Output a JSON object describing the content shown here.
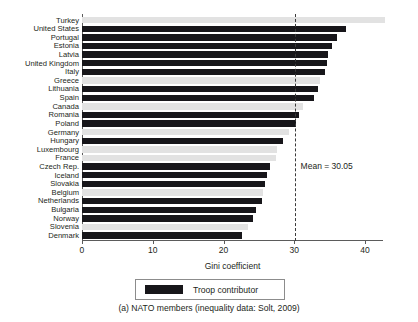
{
  "caption": "(a) NATO members (inequality data: Solt, 2009)",
  "legend": {
    "items": [
      {
        "label": "Troop contributor",
        "color": "#17161a",
        "swatch_name": "troop-contributor-swatch"
      }
    ]
  },
  "annotations": {
    "mean_label": "Mean = 30.05",
    "mean_value": 30.05
  },
  "axis": {
    "x_title": "Gini coefficient",
    "x_ticks": [
      "0",
      "10",
      "20",
      "30",
      "40"
    ]
  },
  "colors": {
    "troop_contributor": "#17161a",
    "non_contributor": "#e2e2e2",
    "axis": "#5b5b5b",
    "mean_line": "#3a3a3a",
    "text": "#231f20"
  },
  "chart_data": {
    "type": "bar",
    "orientation": "horizontal",
    "title": "",
    "subtitle": "",
    "xlabel": "Gini coefficient",
    "ylabel": "",
    "xlim": [
      0,
      42.5
    ],
    "xticks": [
      0,
      10,
      20,
      30,
      40
    ],
    "grid": false,
    "legend_position": "bottom",
    "annotations": [
      {
        "type": "vline",
        "value": 30.05,
        "label": "Mean = 30.05",
        "style": "dashed"
      }
    ],
    "series": [
      {
        "name": "Troop contributor",
        "color": "#17161a"
      },
      {
        "name": "Non contributor",
        "color": "#e2e2e2"
      }
    ],
    "categories": [
      "Turkey",
      "United States",
      "Portugal",
      "Estonia",
      "Latvia",
      "United Kingdom",
      "Italy",
      "Greece",
      "Lithuania",
      "Spain",
      "Canada",
      "Romania",
      "Poland",
      "Germany",
      "Hungary",
      "Luxembourg",
      "France",
      "Czech Rep.",
      "Iceland",
      "Slovakia",
      "Belgium",
      "Netherlands",
      "Bulgaria",
      "Norway",
      "Slovenia",
      "Denmark"
    ],
    "values": [
      42.8,
      37.3,
      36.1,
      35.3,
      34.8,
      34.6,
      34.4,
      33.6,
      33.3,
      32.8,
      31.3,
      30.7,
      30.2,
      29.2,
      28.4,
      27.6,
      27.4,
      26.6,
      26.2,
      25.9,
      25.6,
      25.4,
      24.6,
      24.1,
      23.4,
      22.6
    ],
    "troop_contributor": [
      false,
      true,
      true,
      true,
      true,
      true,
      true,
      false,
      true,
      true,
      false,
      true,
      true,
      false,
      true,
      false,
      false,
      true,
      true,
      true,
      false,
      true,
      true,
      true,
      false,
      true
    ]
  }
}
